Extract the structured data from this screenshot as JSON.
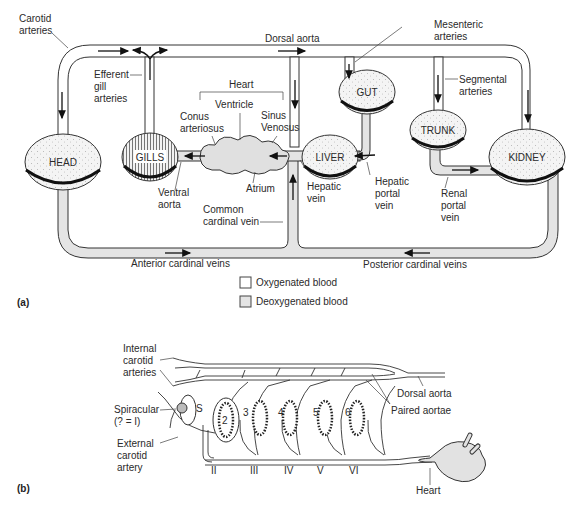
{
  "panel_a": {
    "label": "(a)",
    "organs": {
      "head": "HEAD",
      "gills": "GILLS",
      "liver": "LIVER",
      "gut": "GUT",
      "trunk": "TRUNK",
      "kidney": "KIDNEY"
    },
    "labels": {
      "carotid_arteries_1": "Carotid",
      "carotid_arteries_2": "arteries",
      "dorsal_aorta": "Dorsal aorta",
      "mesenteric_1": "Mesenteric",
      "mesenteric_2": "arteries",
      "efferent_1": "Efferent",
      "efferent_2": "gill",
      "efferent_3": "arteries",
      "heart": "Heart",
      "ventricle": "Ventricle",
      "conus_1": "Conus",
      "conus_2": "arteriosus",
      "sinus_1": "Sinus",
      "sinus_2": "Venosus",
      "segmental_1": "Segmental",
      "segmental_2": "arteries",
      "atrium": "Atrium",
      "ventral_aorta_1": "Ventral",
      "ventral_aorta_2": "aorta",
      "hepatic_vein_1": "Hepatic",
      "hepatic_vein_2": "vein",
      "hepatic_portal_1": "Hepatic",
      "hepatic_portal_2": "portal",
      "hepatic_portal_3": "vein",
      "renal_portal_1": "Renal",
      "renal_portal_2": "portal",
      "renal_portal_3": "vein",
      "common_cardinal_1": "Common",
      "common_cardinal_2": "cardinal vein",
      "anterior_cardinal": "Anterior cardinal veins",
      "posterior_cardinal": "Posterior cardinal veins"
    },
    "legend": [
      {
        "label": "Oxygenated blood",
        "color": "#ffffff"
      },
      {
        "label": "Deoxygenated blood",
        "color": "#e4e4e4"
      }
    ]
  },
  "panel_b": {
    "label": "(b)",
    "labels": {
      "internal_carotid_1": "Internal",
      "internal_carotid_2": "carotid",
      "internal_carotid_3": "arteries",
      "spiracular_1": "Spiracular",
      "spiracular_2": "(? = I)",
      "external_carotid_1": "External",
      "external_carotid_2": "carotid",
      "external_carotid_3": "artery",
      "dorsal_aorta": "Dorsal aorta",
      "paired_aortae": "Paired aortae",
      "heart": "Heart",
      "spiracle": "S"
    },
    "gill_numbers": [
      "2",
      "3",
      "4",
      "5",
      "6"
    ],
    "arch_numerals": [
      "II",
      "III",
      "IV",
      "V",
      "VI"
    ]
  }
}
